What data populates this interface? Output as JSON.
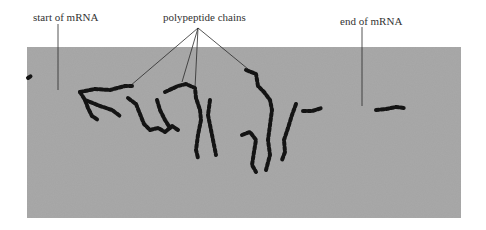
{
  "figure": {
    "type": "electron micrograph of polysome",
    "labels": {
      "start": "start of mRNA",
      "chains": "polypeptide chains",
      "end": "end of mRNA"
    },
    "colors": {
      "background": "#ffffff",
      "photo_gray": "#a9a9a9",
      "ribosome_dots": "#141414",
      "leader_lines": "#2a2a2a"
    }
  }
}
